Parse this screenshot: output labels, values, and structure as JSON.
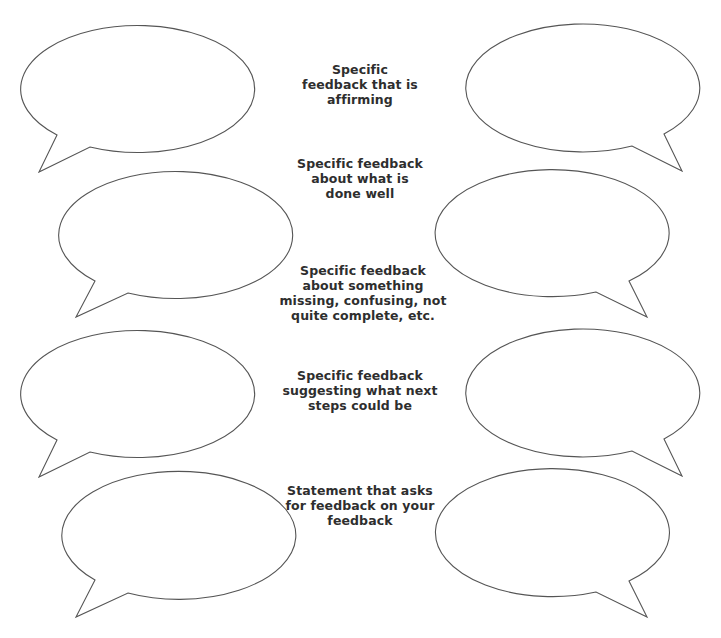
{
  "worksheet": {
    "prompts": [
      {
        "lines": [
          "Specific",
          "feedback that is",
          "affirming"
        ]
      },
      {
        "lines": [
          "Specific feedback",
          "about what is",
          "done well"
        ]
      },
      {
        "lines": [
          "Specific feedback",
          "about something",
          "missing, confusing, not",
          "quite complete, etc."
        ]
      },
      {
        "lines": [
          "Specific feedback",
          "suggesting what next",
          "steps could be"
        ]
      },
      {
        "lines": [
          "Statement that asks",
          "for feedback on your",
          "feedback"
        ]
      }
    ],
    "bubbles": [
      {
        "id": "row1-left",
        "side": "left",
        "cx": 133,
        "cy": 87,
        "rx": 117,
        "ry": 63.5
      },
      {
        "id": "row1-right",
        "side": "right",
        "cx": 587,
        "cy": 87,
        "rx": 117,
        "ry": 64
      },
      {
        "id": "row2-left",
        "side": "left",
        "cx": 171,
        "cy": 234,
        "rx": 117,
        "ry": 63.5
      },
      {
        "id": "row2-right",
        "side": "right",
        "cx": 551,
        "cy": 234,
        "rx": 117,
        "ry": 63.5
      },
      {
        "id": "row3-left",
        "side": "left",
        "cx": 133,
        "cy": 392,
        "rx": 117,
        "ry": 63.5
      },
      {
        "id": "row3-right",
        "side": "right",
        "cx": 587,
        "cy": 392,
        "rx": 117,
        "ry": 64
      },
      {
        "id": "row4-left",
        "side": "left",
        "cx": 171,
        "cy": 533,
        "rx": 117,
        "ry": 64
      },
      {
        "id": "row4-right",
        "side": "right",
        "cx": 551,
        "cy": 533,
        "rx": 117,
        "ry": 64
      }
    ]
  },
  "colors": {
    "stroke": "#555555",
    "text": "#2e2e2e",
    "background": "#ffffff"
  }
}
